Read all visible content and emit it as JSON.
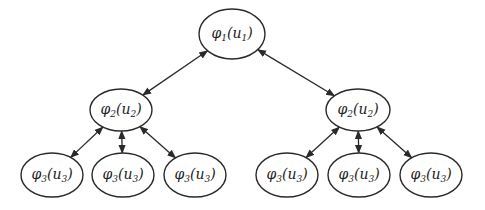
{
  "diagram": {
    "type": "tree",
    "edge_style": "bidirectional-arrow",
    "nodes": [
      {
        "id": "root",
        "func": "φ",
        "sub": "1",
        "arg": "u",
        "arg_sub": "1",
        "level": 1
      },
      {
        "id": "mid-left",
        "func": "φ",
        "sub": "2",
        "arg": "u",
        "arg_sub": "2",
        "level": 2
      },
      {
        "id": "mid-right",
        "func": "φ",
        "sub": "2",
        "arg": "u",
        "arg_sub": "2",
        "level": 2
      },
      {
        "id": "leaf-1",
        "func": "φ",
        "sub": "3",
        "arg": "u",
        "arg_sub": "3",
        "level": 3
      },
      {
        "id": "leaf-2",
        "func": "φ",
        "sub": "3",
        "arg": "u",
        "arg_sub": "3",
        "level": 3
      },
      {
        "id": "leaf-3",
        "func": "φ",
        "sub": "3",
        "arg": "u",
        "arg_sub": "3",
        "level": 3
      },
      {
        "id": "leaf-4",
        "func": "φ",
        "sub": "3",
        "arg": "u",
        "arg_sub": "3",
        "level": 3
      },
      {
        "id": "leaf-5",
        "func": "φ",
        "sub": "3",
        "arg": "u",
        "arg_sub": "3",
        "level": 3
      },
      {
        "id": "leaf-6",
        "func": "φ",
        "sub": "3",
        "arg": "u",
        "arg_sub": "3",
        "level": 3
      }
    ],
    "edges": [
      {
        "from": "root",
        "to": "mid-left"
      },
      {
        "from": "root",
        "to": "mid-right"
      },
      {
        "from": "mid-left",
        "to": "leaf-1"
      },
      {
        "from": "mid-left",
        "to": "leaf-2"
      },
      {
        "from": "mid-left",
        "to": "leaf-3"
      },
      {
        "from": "mid-right",
        "to": "leaf-4"
      },
      {
        "from": "mid-right",
        "to": "leaf-5"
      },
      {
        "from": "mid-right",
        "to": "leaf-6"
      }
    ]
  }
}
